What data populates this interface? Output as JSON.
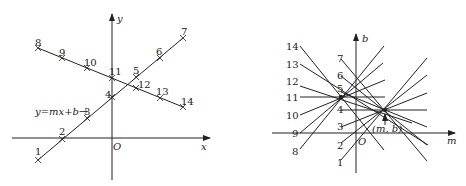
{
  "left_panel": {
    "x_axis_label": "x",
    "y_axis_label": "y",
    "origin_label": "O",
    "line_annotation": "y=mx+b→",
    "points_line_a": [
      "1",
      "2",
      "3",
      "4",
      "5",
      "6",
      "7"
    ],
    "points_line_b": [
      "8",
      "9",
      "10",
      "11",
      "12",
      "13",
      "14"
    ]
  },
  "right_panel": {
    "x_axis_label": "m",
    "y_axis_label": "b",
    "origin_label": "O",
    "point_label": "(m, b)",
    "line_labels": [
      "1",
      "2",
      "3",
      "4",
      "5",
      "6",
      "7",
      "8",
      "9",
      "10",
      "11",
      "12",
      "13",
      "14"
    ]
  }
}
